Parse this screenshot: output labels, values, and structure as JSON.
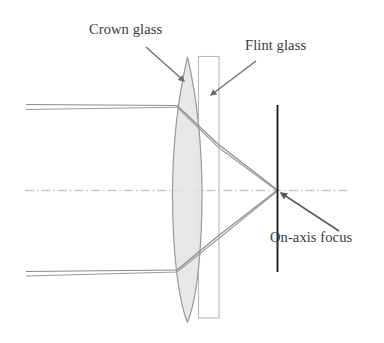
{
  "diagram": {
    "labels": {
      "crown_glass": "Crown glass",
      "flint_glass": "Flint glass",
      "on_axis_focus": "On-axis focus"
    },
    "colors": {
      "crown_fill": "#e2e2e2",
      "crown_stroke": "#8d8d8d",
      "flint_stroke": "#b3b3b3",
      "ray_stroke": "#8a8a8a",
      "focal_plane_stroke": "#1a1a1a",
      "axis_stroke": "#c9c9c9",
      "leader_stroke": "#6e6e6e",
      "text": "#3a3a3a",
      "background": "#ffffff"
    },
    "elements": {
      "crown_lens": {
        "name": "crown-glass-lens",
        "shape": "biconvex-ellipse",
        "x_left": 172,
        "x_right": 202,
        "y_top": 57,
        "y_bottom": 322
      },
      "flint_element": {
        "name": "flint-glass-element",
        "shape": "rectangle",
        "x_left": 198,
        "x_right": 219,
        "y_top": 56,
        "y_bottom": 318
      },
      "optical_axis": {
        "name": "optical-axis",
        "style": "dash-dot",
        "y": 190,
        "x_start": 25,
        "x_end": 348
      },
      "focal_plane": {
        "name": "focal-plane-line",
        "x": 277,
        "y_top": 105,
        "y_bottom": 272
      },
      "focus_point": {
        "name": "on-axis-focus-point",
        "x": 277,
        "y": 190
      },
      "rays": [
        {
          "name": "upper-ray-bundle",
          "entry_y": 106,
          "exit_y": 190
        },
        {
          "name": "lower-ray-bundle",
          "entry_y": 270,
          "exit_y": 190
        }
      ],
      "leaders": [
        {
          "name": "crown-glass-leader",
          "x1": 146,
          "y1": 47,
          "x2": 184,
          "y2": 81
        },
        {
          "name": "flint-glass-leader",
          "x1": 256,
          "y1": 61,
          "x2": 211,
          "y2": 95
        },
        {
          "name": "on-axis-focus-leader",
          "x1": 339,
          "y1": 231,
          "x2": 280,
          "y2": 193
        }
      ]
    }
  }
}
